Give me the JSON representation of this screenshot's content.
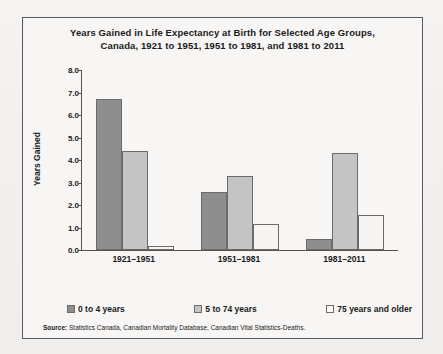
{
  "figure": {
    "title": "Years Gained in Life Expectancy at Birth for Selected Age Groups, Canada, 1921 to 1951, 1951 to 1981, and 1981 to 2011",
    "title_line1": "Years Gained in Life Expectancy at Birth for Selected Age Groups,",
    "title_line2": "Canada, 1921 to 1951, 1951 to 1981, and 1981 to 2011",
    "source_prefix": "Source:",
    "source_text": "Statistics Canada, Canadian Mortality Database, Canadian Vital Statistics-Deaths."
  },
  "colors": {
    "series_0_to_4": "#8e8e8e",
    "series_5_to_74": "#c4c4c4",
    "series_75_plus": "#f6f5f3",
    "bar_outline": "#6e6a67",
    "axis": "#55514e",
    "frame": "#5a5a5a",
    "background": "#f7f6f4",
    "text": "#1a1a1a"
  },
  "chart_data": {
    "type": "bar",
    "title": "Years Gained in Life Expectancy at Birth for Selected Age Groups, Canada, 1921 to 1951, 1951 to 1981, and 1981 to 2011",
    "xlabel": "",
    "ylabel": "Years Gained",
    "ylim": [
      0.0,
      8.0
    ],
    "ytick_step": 1.0,
    "yticks": [
      "8.0",
      "7.0",
      "6.0",
      "5.0",
      "4.0",
      "3.0",
      "2.0",
      "1.0",
      "0.0"
    ],
    "ytick_values": [
      8.0,
      7.0,
      6.0,
      5.0,
      4.0,
      3.0,
      2.0,
      1.0,
      0.0
    ],
    "grid": false,
    "legend_position": "bottom",
    "categories": [
      "1921–1951",
      "1951–1981",
      "1981–2011"
    ],
    "series": [
      {
        "name": "0 to 4 years",
        "values": [
          6.7,
          2.6,
          0.5
        ]
      },
      {
        "name": "5 to 74 years",
        "values": [
          4.4,
          3.3,
          4.3
        ]
      },
      {
        "name": "75 years and older",
        "values": [
          0.2,
          1.15,
          1.55
        ]
      }
    ]
  }
}
